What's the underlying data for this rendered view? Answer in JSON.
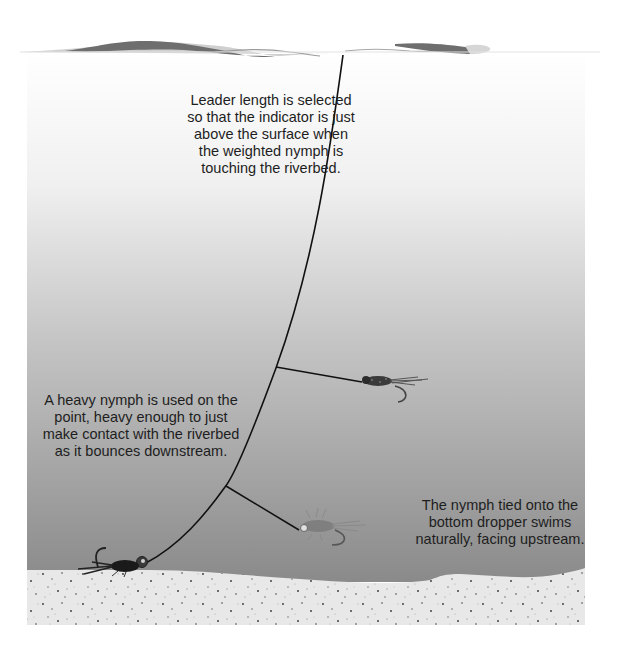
{
  "diagram": {
    "colors": {
      "water_top": "#ffffff",
      "water_bottom": "#8c8c8c",
      "surface_wave_dark": "#6e6e6e",
      "surface_wave_light": "#cfcfcf",
      "riverbed": "#e6e6e6",
      "riverbed_speckle": "#333333",
      "leader_line": "#111111",
      "text": "#1e1e1e"
    },
    "captions": {
      "leader_length": "Leader length is selected so that the indicator is just above the surface when the weighted nymph is touching the riverbed.",
      "heavy_nymph": "A heavy nymph is used on the point, heavy enough to just make contact with the riverbed as it bounces downstream.",
      "bottom_dropper": "The nymph tied onto the bottom dropper swims naturally, facing upstream."
    },
    "elements": {
      "surface": "water-surface",
      "leader": "leader-line",
      "upper_dropper": "upper-dropper-nymph",
      "lower_dropper": "lower-dropper-nymph",
      "point_fly": "weighted-point-nymph",
      "riverbed": "riverbed"
    }
  }
}
